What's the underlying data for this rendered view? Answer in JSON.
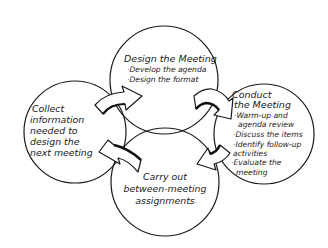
{
  "diagram": {
    "type": "cycle",
    "style": "hand-drawn",
    "colors": {
      "stroke": "#1a1a1a",
      "background": "#ffffff",
      "arrow_fill": "#ffffff",
      "arrow_shadow": "#111111"
    },
    "nodes": {
      "design": {
        "title": "Design the Meeting",
        "items": [
          "·Develop the agenda",
          "·Design the format"
        ]
      },
      "conduct": {
        "title_lines": [
          "Conduct",
          "the Meeting"
        ],
        "items": [
          "·Warm-up and",
          "agenda review",
          "·Discuss the items",
          "·Identify follow-up",
          "activities",
          "·Evaluate the",
          "meeting"
        ]
      },
      "carry_out": {
        "lines": [
          "Carry out",
          "between-meeting",
          "assignments"
        ]
      },
      "collect": {
        "lines": [
          "Collect",
          "information",
          "needed to",
          "design the",
          "next meeting"
        ]
      }
    },
    "edges": [
      {
        "from": "collect",
        "to": "design",
        "icon": "curved-arrow-icon"
      },
      {
        "from": "design",
        "to": "conduct",
        "icon": "curved-arrow-icon"
      },
      {
        "from": "conduct",
        "to": "carry_out",
        "icon": "curved-arrow-icon"
      },
      {
        "from": "carry_out",
        "to": "collect",
        "icon": "curved-arrow-icon"
      }
    ]
  }
}
